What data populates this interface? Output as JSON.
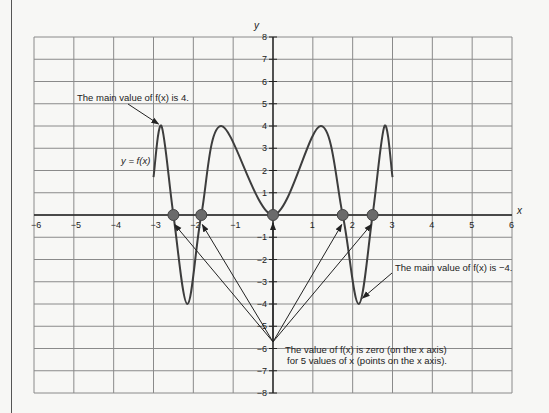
{
  "chart_data": {
    "type": "line",
    "title": "",
    "xlabel": "x",
    "ylabel": "y",
    "xlim": [
      -6,
      6
    ],
    "ylim": [
      -8,
      8
    ],
    "grid": true,
    "x_ticks": [
      -6,
      -5,
      -4,
      -3,
      -2,
      -1,
      1,
      2,
      3,
      4,
      5,
      6
    ],
    "x_tick_labels": [
      "−6",
      "−5",
      "−4",
      "−3",
      "−2",
      "−1",
      "1",
      "2",
      "3",
      "4",
      "5",
      "6"
    ],
    "y_ticks": [
      8,
      7,
      6,
      5,
      4,
      3,
      2,
      1,
      -1,
      -2,
      -3,
      -4,
      -5,
      -6,
      -7,
      -8
    ],
    "y_tick_labels": [
      "8",
      "7",
      "6",
      "5",
      "4",
      "3",
      "2",
      "1",
      "−1",
      "−2",
      "−3",
      "−4",
      "−5",
      "−6",
      "−7",
      "−8"
    ],
    "series": [
      {
        "name": "y = f(x)",
        "label": "y = f(x)",
        "points": [
          [
            -3.0,
            1.7
          ],
          [
            -2.8,
            4.0
          ],
          [
            -2.5,
            0.0
          ],
          [
            -2.15,
            -4.0
          ],
          [
            -1.8,
            0.0
          ],
          [
            -1.3,
            4.0
          ],
          [
            0.0,
            0.0
          ],
          [
            1.2,
            4.0
          ],
          [
            1.75,
            0.0
          ],
          [
            2.15,
            -4.0
          ],
          [
            2.5,
            0.0
          ],
          [
            2.8,
            4.0
          ],
          [
            3.0,
            1.7
          ]
        ]
      }
    ],
    "zeros": [
      -2.5,
      -1.8,
      0.0,
      1.75,
      2.5
    ],
    "maximum": {
      "x": -2.8,
      "y": 4
    },
    "minimum": {
      "x": 2.15,
      "y": -4
    },
    "annotations": [
      {
        "id": "max",
        "text_parts": [
          "The main value of ",
          "f",
          "(",
          "x",
          ") is 4."
        ],
        "text": "The main value of f(x) is 4."
      },
      {
        "id": "min",
        "text_parts": [
          "The main value of ",
          "f",
          "(",
          "x",
          ") is −4."
        ],
        "text": "The main value of f(x) is −4."
      },
      {
        "id": "zeros_line1",
        "text": "The value of f(x) is zero (on the x axis)"
      },
      {
        "id": "zeros_line2",
        "text": "for 5 values of x (points on the x axis)."
      },
      {
        "id": "curve_label",
        "text": "y = f(x)"
      }
    ],
    "zeros_arrow_origin": {
      "x": 0,
      "y": -5.7
    }
  },
  "colors": {
    "curve": "#3d3d3d",
    "grid": "#8a8a8a",
    "axis": "#222222",
    "zero_point": "#6b6b6b",
    "background": "#f7f7f5"
  },
  "labels": {
    "ann_max": "The main value of f(x) is 4.",
    "ann_min": "The main value of f(x) is −4.",
    "ann_zero_1": "The value of f(x) is zero (on the x axis)",
    "ann_zero_2": "for 5 values of x (points on the x axis).",
    "curve": "y = f(x)",
    "x_axis": "x",
    "y_axis": "y"
  }
}
